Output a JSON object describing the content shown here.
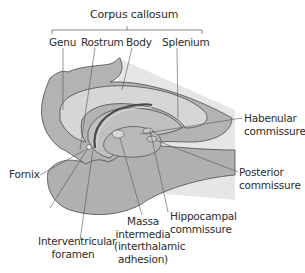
{
  "diagram": {
    "title": "Corpus callosum",
    "colors": {
      "dark_tissue": "#a9a9a9",
      "mid_tissue": "#c6c6c6",
      "light_tissue": "#dcdcdc",
      "outline": "#4a4a4a",
      "leader_line": "#555555",
      "text": "#2b2b2b"
    },
    "labels": {
      "corpus_callosum": "Corpus callosum",
      "genu": "Genu",
      "rostrum": "Rostrum",
      "body": "Body",
      "splenium": "Splenium",
      "habenular_1": "Habenular",
      "habenular_2": "commissure",
      "posterior_1": "Posterior",
      "posterior_2": "commissure",
      "fornix": "Fornix",
      "interventricular_1": "Interventricular",
      "interventricular_2": "foramen",
      "massa_1": "Massa",
      "massa_2": "intermedia",
      "massa_3": "(interthalamic",
      "massa_4": "adhesion)",
      "hippocampal_1": "Hippocampal",
      "hippocampal_2": "commissure"
    }
  }
}
